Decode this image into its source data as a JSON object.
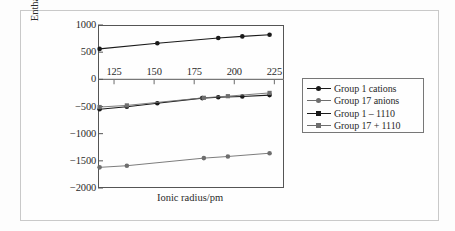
{
  "figure": {
    "background_color": "#fdfdfd",
    "border_color": "#c9c9c9",
    "axis_color": "#555555"
  },
  "chart_data": {
    "type": "line",
    "title": "",
    "xlabel": "Ionic radius/pm",
    "ylabel": "Enthalpy of hydration/kJ mol⁻¹",
    "xlim": [
      115,
      231
    ],
    "ylim": [
      -2000,
      1000
    ],
    "xticks": [
      125,
      150,
      175,
      200,
      225
    ],
    "yticks": [
      1000,
      500,
      0,
      -500,
      -1000,
      -1500,
      -2000
    ],
    "ytick_labels": [
      "1000",
      "500",
      "0",
      "−500",
      "−1000",
      "−1500",
      "−2000"
    ],
    "xtick_labels": [
      "125",
      "150",
      "175",
      "200",
      "225"
    ],
    "grid": false,
    "x_axis_position": "zero-line",
    "legend_position": "right-outside",
    "series": [
      {
        "name": "Group 1 cations",
        "color": "#1a1a1a",
        "marker": "circle",
        "x": [
          116,
          133,
          152,
          180,
          190,
          205,
          222
        ],
        "y": [
          -550,
          -505,
          -440,
          -345,
          -330,
          -315,
          -290
        ]
      },
      {
        "name": "Group 17 anions",
        "color": "#6e6e6e",
        "marker": "circle",
        "x": [
          116,
          133,
          181,
          196,
          222
        ],
        "y": [
          -1620,
          -1590,
          -1450,
          -1420,
          -1360
        ]
      },
      {
        "name": "Group 1 − 1110",
        "color": "#1a1a1a",
        "marker": "circle",
        "x": [
          116,
          152,
          190,
          205,
          222
        ],
        "y": [
          560,
          665,
          760,
          790,
          820
        ]
      },
      {
        "name": "Group 17 + 1110",
        "color": "#6e6e6e",
        "marker": "square",
        "x": [
          116,
          133,
          181,
          196,
          222
        ],
        "y": [
          -510,
          -480,
          -340,
          -310,
          -250
        ]
      }
    ]
  },
  "legend": {
    "items": [
      {
        "label": "Group 1 cations",
        "color": "#1a1a1a",
        "marker": "circle"
      },
      {
        "label": "Group 17 anions",
        "color": "#6e6e6e",
        "marker": "circle"
      },
      {
        "label": "Group 1 – 1110",
        "color": "#1a1a1a",
        "marker": "square"
      },
      {
        "label": "Group 17 + 1110",
        "color": "#6e6e6e",
        "marker": "square"
      }
    ]
  }
}
